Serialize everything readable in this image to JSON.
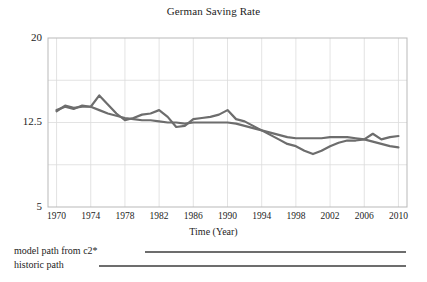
{
  "chart_data": {
    "type": "line",
    "title": "German Saving Rate",
    "xlabel": "Time (Year)",
    "ylabel": "",
    "xlim": [
      1969,
      2011
    ],
    "ylim": [
      5,
      20
    ],
    "grid": true,
    "legend_position": "below-axes",
    "yticks": [
      "20",
      "12.5",
      "5"
    ],
    "ytick_values": [
      20,
      12.5,
      5
    ],
    "xticks": [
      "1970",
      "1974",
      "1978",
      "1982",
      "1986",
      "1990",
      "1994",
      "1998",
      "2002",
      "2006",
      "2010"
    ],
    "xtick_values": [
      1970,
      1974,
      1978,
      1982,
      1986,
      1990,
      1994,
      1998,
      2002,
      2006,
      2010
    ],
    "x": [
      1970,
      1971,
      1972,
      1973,
      1974,
      1975,
      1976,
      1977,
      1978,
      1979,
      1980,
      1981,
      1982,
      1983,
      1984,
      1985,
      1986,
      1987,
      1988,
      1989,
      1990,
      1991,
      1992,
      1993,
      1994,
      1995,
      1996,
      1997,
      1998,
      1999,
      2000,
      2001,
      2002,
      2003,
      2004,
      2005,
      2006,
      2007,
      2008,
      2009,
      2010
    ],
    "series": [
      {
        "name": "model path from  c2*",
        "color": "#6d6d6d",
        "values": [
          13.6,
          13.9,
          13.7,
          14.0,
          13.9,
          14.9,
          14.1,
          13.3,
          12.7,
          12.9,
          13.2,
          13.3,
          13.6,
          13.0,
          12.1,
          12.2,
          12.8,
          12.9,
          13.0,
          13.2,
          13.6,
          12.8,
          12.6,
          12.2,
          11.8,
          11.4,
          11.0,
          10.6,
          10.4,
          10.0,
          9.7,
          10.0,
          10.4,
          10.7,
          10.9,
          10.9,
          11.0,
          11.5,
          11.0,
          11.2,
          11.3
        ]
      },
      {
        "name": "historic path",
        "color": "#6d6d6d",
        "values": [
          13.5,
          14.0,
          13.8,
          13.9,
          13.9,
          13.6,
          13.3,
          13.1,
          12.9,
          12.8,
          12.7,
          12.7,
          12.6,
          12.5,
          12.5,
          12.4,
          12.5,
          12.5,
          12.5,
          12.5,
          12.5,
          12.4,
          12.2,
          12.0,
          11.8,
          11.6,
          11.4,
          11.2,
          11.1,
          11.1,
          11.1,
          11.1,
          11.2,
          11.2,
          11.2,
          11.1,
          11.0,
          10.8,
          10.6,
          10.4,
          10.3
        ]
      }
    ]
  },
  "legend": {
    "items": [
      {
        "label": "model path from  c2*"
      },
      {
        "label": "historic path"
      }
    ]
  },
  "colors": {
    "line": "#6d6d6d",
    "axis": "#b9b9b9",
    "grid": "#dcdcdc",
    "text": "#1d1d1d"
  }
}
